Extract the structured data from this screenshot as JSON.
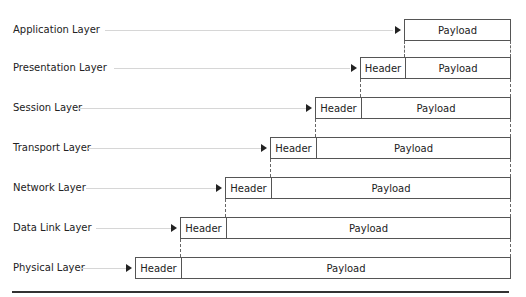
{
  "diagram": {
    "title": "",
    "layers": [
      {
        "label": "Application Layer",
        "header": null,
        "payload": "Payload",
        "box_left": 404,
        "header_right": 404,
        "top": 19
      },
      {
        "label": "Presentation Layer",
        "header": "Header",
        "payload": "Payload",
        "box_left": 360,
        "header_right": 404,
        "top": 57
      },
      {
        "label": "Session Layer",
        "header": "Header",
        "payload": "Payload",
        "box_left": 315,
        "header_right": 360,
        "top": 97
      },
      {
        "label": "Transport Layer",
        "header": "Header",
        "payload": "Payload",
        "box_left": 270,
        "header_right": 315,
        "top": 137
      },
      {
        "label": "Network Layer",
        "header": "Header",
        "payload": "Payload",
        "box_left": 225,
        "header_right": 270,
        "top": 177
      },
      {
        "label": "Data Link Layer",
        "header": "Header",
        "payload": "Payload",
        "box_left": 180,
        "header_right": 225,
        "top": 217
      },
      {
        "label": "Physical Layer",
        "header": "Header",
        "payload": "Payload",
        "box_left": 135,
        "header_right": 180,
        "top": 257
      }
    ],
    "box_right": 511,
    "box_height": 22,
    "colors": {
      "border": "#555555",
      "connector": "#d6d6d6",
      "arrow": "#222222",
      "text": "#222222",
      "rule": "#333333"
    }
  }
}
